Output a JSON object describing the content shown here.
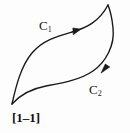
{
  "figure": {
    "caption": "[1–1]",
    "background_color": "#fdfdfd",
    "stroke_color": "#1a1a1a",
    "labels": {
      "upper_curve": {
        "base": "C",
        "subscript": "1",
        "full": "C₁"
      },
      "lower_curve": {
        "base": "C",
        "subscript": "2",
        "full": "C₂"
      }
    },
    "geometry": {
      "description": "Closed lens/leaf-shaped region bounded by two oriented curves meeting at two cusps",
      "cusp_bottom_left": {
        "x": 12,
        "y": 104
      },
      "cusp_top_right": {
        "x": 108,
        "y": 5
      },
      "upper_curve_path": "M 12 104 C 18 74, 26 50, 45 38 C 64 26, 80 30, 92 22 C 100 17, 105 11, 108 5",
      "lower_curve_path": "M 12 104 C 22 92, 36 86, 56 85 C 78 84, 98 78, 110 62 C 118 48, 118 28, 108 5",
      "arrow_upper": {
        "x": 76,
        "y": 29,
        "direction": "up-right"
      },
      "arrow_lower": {
        "x": 107,
        "y": 69,
        "direction": "up-right"
      },
      "stroke_width": 1.4
    }
  }
}
